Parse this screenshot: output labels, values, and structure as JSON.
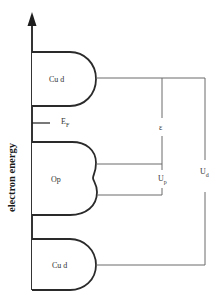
{
  "diagram": {
    "type": "energy-level-diagram",
    "axis": {
      "label": "electron energy",
      "direction": "up"
    },
    "bands": [
      {
        "id": "cu-d-upper",
        "label": "Cu d"
      },
      {
        "id": "o-p",
        "label": "Op"
      },
      {
        "id": "cu-d-lower",
        "label": "Cu d"
      }
    ],
    "fermi_level": {
      "label": "E",
      "subscript": "F"
    },
    "energies": {
      "epsilon": {
        "label": "ε"
      },
      "u_p": {
        "label": "U",
        "subscript": "p"
      },
      "u_d": {
        "label": "U",
        "subscript": "d"
      }
    },
    "colors": {
      "line": "#2a2a2a",
      "connector": "#6a6a6a",
      "background": "#ffffff"
    }
  }
}
